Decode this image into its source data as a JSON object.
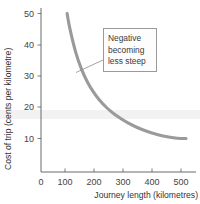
{
  "chart_data": {
    "type": "line",
    "title": "",
    "xlabel": "Journey length (kilometres)",
    "ylabel": "Cost of trip (cents per kilometre)",
    "xlim": [
      0,
      520
    ],
    "ylim": [
      0,
      54
    ],
    "xticks": [
      0,
      100,
      200,
      300,
      400,
      500
    ],
    "xtick_labels": [
      "0",
      "100",
      "200",
      "300",
      "400",
      "500"
    ],
    "yticks": [
      10,
      20,
      30,
      40,
      50
    ],
    "ytick_labels": [
      "10",
      "20",
      "30",
      "40",
      "50"
    ],
    "grid": false,
    "legend": false,
    "series": [
      {
        "name": "Cost of trip",
        "color": "#9a9a9a",
        "x": [
          90,
          100,
          120,
          140,
          160,
          180,
          200,
          225,
          250,
          275,
          300,
          330,
          360,
          400,
          440,
          470,
          500
        ],
        "y": [
          50.0,
          45.0,
          37.5,
          32.1,
          28.1,
          25.0,
          22.5,
          20.0,
          18.0,
          16.4,
          15.0,
          13.6,
          12.5,
          11.3,
          10.5,
          10.1,
          10.0
        ]
      }
    ],
    "annotations": [
      {
        "name": "slope-callout",
        "lines": [
          "Negative",
          "becoming",
          "less steep"
        ],
        "points_to_x": 152,
        "points_to_y": 28.5
      }
    ]
  },
  "axes": {
    "x_title": "Journey length (kilometres)",
    "y_title": "Cost of trip (cents per kilometre)",
    "x_tick_labels": [
      "0",
      "100",
      "200",
      "300",
      "400",
      "500"
    ],
    "y_tick_labels": [
      "10",
      "20",
      "30",
      "40",
      "50"
    ]
  },
  "annotation": {
    "line1": "Negative",
    "line2": "becoming",
    "line3": "less steep"
  },
  "colors": {
    "curve": "#9a9a9a",
    "axis": "#5a5a5a",
    "text": "#333333",
    "background": "#ffffff",
    "note_border": "#9b9b9b"
  }
}
